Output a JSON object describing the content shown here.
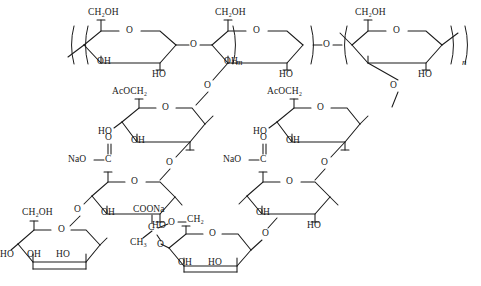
{
  "figure": {
    "type": "chemical-structure",
    "name": "xanthan-gum-repeat-unit",
    "background_color": "#ffffff",
    "line_color": "#1a1a1a"
  },
  "labels": {
    "ch2oh_1": "CH₂OH",
    "ch2oh_2": "CH₂OH",
    "ch2oh_3": "CH₂OH",
    "ch2oh_4": "CH₂OH",
    "ch2oh_5": "CH₂OH",
    "ring_o_1": "O",
    "ring_o_2": "O",
    "ring_o_3": "O",
    "ring_o_4": "O",
    "ring_o_5": "O",
    "ring_o_6": "O",
    "ring_o_7": "O",
    "ring_o_8": "O",
    "ring_o_9": "O",
    "oh_1": "OH",
    "ho_1": "HO",
    "oh_2": "OH",
    "ho_2": "HO",
    "link_o_1": "O",
    "link_o_2": "O",
    "link_o_branch_1": "O",
    "link_o_branch_2": "O",
    "link_o_branch_3": "O",
    "link_o_branch_4": "O",
    "link_o_branch_5": "O",
    "acoch2_1": "AcOCH₂",
    "acoch2_2": "AcOCH₂",
    "ho_3": "HO",
    "oh_3": "OH",
    "ho_4": "HO",
    "oh_4": "OH",
    "nao_c_1": "NaO",
    "nao_c_2": "NaO",
    "carbonyl_c_1": "C",
    "carbonyl_c_2": "C",
    "carbonyl_o_1": "O",
    "carbonyl_o_2": "O",
    "oh_5": "OH",
    "ho_5": "HO",
    "oh_6": "OH",
    "ho_6": "HO",
    "ho_7": "HO",
    "oh_7": "OH",
    "ho_8": "HO",
    "oh_8": "OH",
    "ho_9": "HO",
    "coona": "COONa",
    "ketal_c": "C",
    "ketal_ch3": "CH₃",
    "ketal_o_1": "O",
    "ketal_o_2": "O",
    "pyr_ch2": "CH₂",
    "pyr_link_o": "O"
  },
  "repeat_indices": {
    "m": "m",
    "n": "n"
  },
  "groups": {
    "backbone": "cellulosic β-1,4-glucan backbone",
    "branch_left": "acetylated mannose → glucuronate → pyruvated mannose",
    "branch_right": "acetylated mannose → glucuronate → terminal mannose"
  }
}
